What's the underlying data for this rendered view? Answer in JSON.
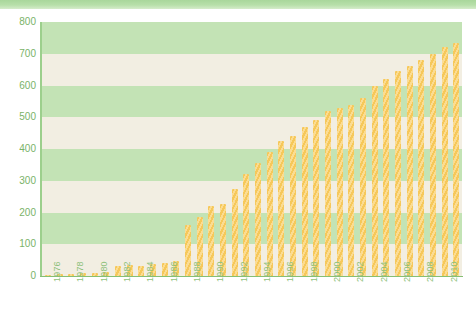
{
  "chart_data": {
    "type": "bar",
    "title": "",
    "subtitle": "",
    "xlabel": "",
    "ylabel": "",
    "ylim": [
      0,
      800
    ],
    "ytick_labels": [
      "0",
      "100",
      "200",
      "300",
      "400",
      "500",
      "600",
      "700",
      "800"
    ],
    "ytick_values": [
      0,
      100,
      200,
      300,
      400,
      500,
      600,
      700,
      800
    ],
    "ytick_step": 100,
    "grid": true,
    "grid_style": "alternating-horizontal-bands",
    "legend": "none",
    "legend_position": "none",
    "xtick_label_step": 2,
    "xtick_labels": [
      "1976",
      "1978",
      "1980",
      "1982",
      "1984",
      "1986",
      "1988",
      "1990",
      "1992",
      "1994",
      "1996",
      "1998",
      "2000",
      "2002",
      "2004",
      "2006",
      "2008",
      "2010"
    ],
    "categories": [
      "1976",
      "1977",
      "1978",
      "1979",
      "1980",
      "1981",
      "1982",
      "1983",
      "1984",
      "1985",
      "1986",
      "1987",
      "1988",
      "1989",
      "1990",
      "1991",
      "1992",
      "1993",
      "1994",
      "1995",
      "1996",
      "1997",
      "1998",
      "1999",
      "2000",
      "2001",
      "2002",
      "2003",
      "2004",
      "2005",
      "2006",
      "2007",
      "2008",
      "2009",
      "2010",
      "2011"
    ],
    "values": [
      4,
      5,
      7,
      8,
      10,
      14,
      30,
      34,
      30,
      38,
      42,
      48,
      160,
      185,
      220,
      228,
      275,
      320,
      355,
      390,
      425,
      440,
      470,
      490,
      520,
      530,
      540,
      560,
      600,
      620,
      645,
      660,
      680,
      700,
      720,
      735
    ]
  },
  "colors": {
    "bar": "#f6c85a",
    "bar_highlight": "#fbdc92",
    "band_green": "#c3e3b5",
    "band_cream": "#f2eee2",
    "axis": "#86bf74",
    "axis_label": "#7ab368",
    "header_strip": "#b7dfa9",
    "page_background": "#ffffff"
  }
}
